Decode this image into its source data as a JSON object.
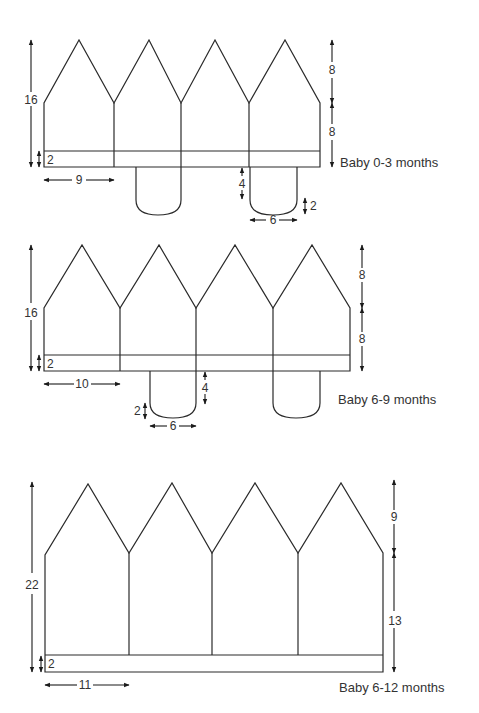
{
  "diagrams": [
    {
      "title": "Baby 0-3 months",
      "total_height": "16",
      "point_height": "8",
      "lower_height": "8",
      "band_height": "2",
      "panel_width": "9",
      "strap_length": "4",
      "strap_curve": "2",
      "strap_width": "6"
    },
    {
      "title": "Baby 6-9 months",
      "total_height": "16",
      "point_height": "8",
      "lower_height": "8",
      "band_height": "2",
      "panel_width": "10",
      "strap_length": "4",
      "strap_curve": "2",
      "strap_width": "6"
    },
    {
      "title": "Baby 6-12 months",
      "total_height": "22",
      "point_height": "9",
      "lower_height": "13",
      "band_height": "2",
      "panel_width": "11"
    }
  ],
  "colors": {
    "line": "#2a2a2a",
    "text": "#333333",
    "background": "#ffffff"
  }
}
